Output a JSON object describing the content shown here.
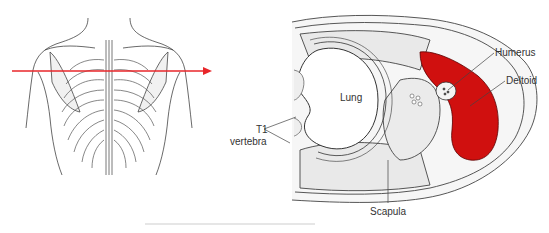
{
  "figure": {
    "left_panel": {
      "subject": "posterior view of thorax and shoulders with ribcage and spine",
      "section_arrow_color": "#e8262a"
    },
    "right_panel": {
      "subject": "transverse section through shoulder at T1 level",
      "highlight_color": "#d0100f",
      "labels": {
        "humerus": "Humerus",
        "deltoid": "Deltoid",
        "lung": "Lung",
        "t1": "T1",
        "vertebra": "vertebra",
        "scapula": "Scapula"
      }
    }
  }
}
